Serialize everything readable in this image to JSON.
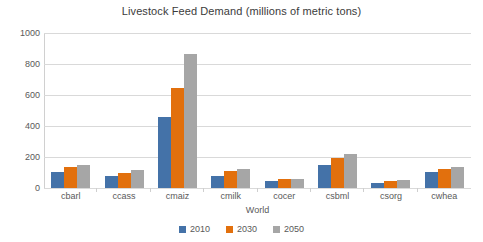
{
  "chart_data": {
    "type": "bar",
    "title": "Livestock Feed Demand (millions of metric tons)",
    "xlabel": "World",
    "ylabel": "",
    "ylim": [
      0,
      1000
    ],
    "yticks": [
      0,
      200,
      400,
      600,
      800,
      1000
    ],
    "grid": true,
    "legend_position": "bottom",
    "categories": [
      "cbarl",
      "ccass",
      "cmaiz",
      "cmilk",
      "cocer",
      "csbml",
      "csorg",
      "cwhea"
    ],
    "series": [
      {
        "name": "2010",
        "color": "#4472a8",
        "values": [
          105,
          80,
          460,
          80,
          45,
          150,
          30,
          105
        ]
      },
      {
        "name": "2030",
        "color": "#e2700d",
        "values": [
          135,
          100,
          645,
          110,
          55,
          195,
          45,
          125
        ]
      },
      {
        "name": "2050",
        "color": "#a6a6a6",
        "values": [
          150,
          115,
          865,
          120,
          60,
          220,
          50,
          135
        ]
      }
    ]
  }
}
